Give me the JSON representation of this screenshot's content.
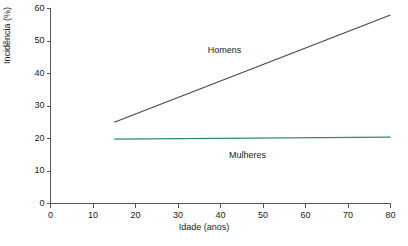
{
  "chart_data": {
    "type": "line",
    "title": "",
    "xlabel": "Idade (anos)",
    "ylabel": "Incidência (%)",
    "xlim": [
      0,
      80
    ],
    "ylim": [
      0,
      60
    ],
    "xticks": [
      0,
      10,
      20,
      30,
      40,
      50,
      60,
      70,
      80
    ],
    "xticklabels": [
      "0",
      "10",
      "20",
      "30",
      "40",
      "50",
      "60",
      "70",
      "80"
    ],
    "yticks": [
      0,
      10,
      20,
      30,
      40,
      50,
      60
    ],
    "yticklabels": [
      "0",
      "10",
      "20",
      "30",
      "40",
      "50",
      "60"
    ],
    "grid": false,
    "legend_position": "inline-annotations",
    "series": [
      {
        "name": "Homens",
        "color": "#4a4a4a",
        "x": [
          15,
          80
        ],
        "values": [
          25,
          58
        ],
        "annotation": {
          "text": "Homens",
          "x": 37,
          "y": 47
        }
      },
      {
        "name": "Mulheres",
        "color": "#2e8b6f",
        "x": [
          15,
          80
        ],
        "values": [
          19.8,
          20.4
        ],
        "annotation": {
          "text": "Mulheres",
          "x": 42,
          "y": 14.5
        }
      }
    ]
  },
  "colors": {
    "homens_line": "#4a4a4a",
    "mulheres_line": "#2e8b6f",
    "axis": "#555555",
    "text": "#1a1a1a",
    "background": "#ffffff"
  }
}
